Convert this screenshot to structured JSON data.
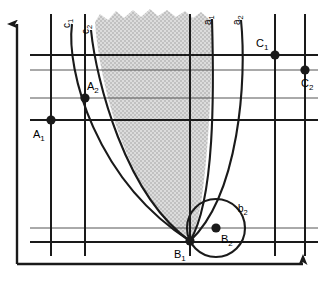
{
  "figure": {
    "kind": "geometric-construction-diagram",
    "background_color": "#ffffff",
    "line_color": "#1a1a1a",
    "shade_fill": "#d9d9d9",
    "width": 323,
    "height": 281
  },
  "axes": {
    "y_axis": {
      "name": "vertical-axis",
      "x": 17,
      "y_top": 20,
      "y_bottom": 264,
      "arrow": "up"
    },
    "x_axis": {
      "name": "horizontal-axis",
      "y": 264,
      "x_left": 17,
      "x_right": 310,
      "arrow": "right"
    }
  },
  "grid": {
    "vertical_lines_x": [
      51,
      85,
      190,
      275,
      305
    ],
    "horizontal_lines_y": [
      55,
      70,
      98,
      120,
      228,
      242
    ],
    "vertical_extent": {
      "y_top": 14,
      "y_bottom": 256
    },
    "horizontal_extent": {
      "x_left": 30,
      "x_right": 318
    },
    "stroke_width_major": 1.9,
    "stroke_width_minor": 1.0
  },
  "points": [
    {
      "id": "A1",
      "label": "A",
      "sub": "1",
      "x": 51,
      "y": 120,
      "label_dx": -16,
      "label_dy": 14
    },
    {
      "id": "A2",
      "label": "A",
      "sub": "2",
      "x": 85,
      "y": 98,
      "label_dx": 4,
      "label_dy": -6
    },
    {
      "id": "B1",
      "label": "B",
      "sub": "1",
      "x": 190,
      "y": 241,
      "label_dx": -14,
      "label_dy": 15
    },
    {
      "id": "B2",
      "label": "B",
      "sub": "2",
      "x": 216,
      "y": 228,
      "label_dx": 5,
      "label_dy": 14
    },
    {
      "id": "C1",
      "label": "C",
      "sub": "1",
      "x": 275,
      "y": 55,
      "label_dx": -18,
      "label_dy": -7
    },
    {
      "id": "C2",
      "label": "C",
      "sub": "2",
      "x": 305,
      "y": 70,
      "label_dx": -4,
      "label_dy": 17
    }
  ],
  "point_radius": 4.6,
  "curves": [
    {
      "id": "c1",
      "label": "c",
      "sub": "1",
      "name": "curve-c1",
      "path": "M 72 24 C 66 70, 95 180, 190 241",
      "label_x": 74,
      "label_y": 22,
      "rotated": true
    },
    {
      "id": "c2",
      "label": "c",
      "sub": "2",
      "name": "curve-c2",
      "path": "M 91 30 C 96 80, 125 195, 190 241",
      "label_x": 92,
      "label_y": 28,
      "rotated": true
    },
    {
      "id": "a1",
      "label": "a",
      "sub": "1",
      "name": "curve-a1",
      "path": "M 212 19 C 214 90, 215 200, 190 241",
      "label_x": 213,
      "label_y": 18,
      "rotated": true
    },
    {
      "id": "a2",
      "label": "a",
      "sub": "2",
      "name": "curve-a2",
      "path": "M 241 20 C 247 80, 239 195, 190 241",
      "label_x": 242,
      "label_y": 18,
      "rotated": true
    }
  ],
  "circle": {
    "id": "b2",
    "label": "b",
    "sub": "2",
    "name": "circle-b2",
    "cx": 216,
    "cy": 228,
    "r": 29,
    "label_x": 240,
    "label_y": 208
  },
  "shaded_region": {
    "name": "shaded-region",
    "fill": "#d9d9d9",
    "description": "hatched region bounded left by c2, right by a1, converging at B1, with ragged upper boundary",
    "ragged_top": true,
    "path": "M 95 22 C 100 90, 130 198, 190 241 C 203 228, 212 120, 212 22 Z"
  },
  "ragged_top_edge": {
    "name": "ragged-edge",
    "points": "95,22 100,14 108,20 116,11 124,18 133,10 141,17 150,9 158,16 167,10 176,17 185,11 193,18 201,12 209,19 212,22"
  }
}
